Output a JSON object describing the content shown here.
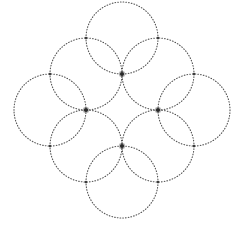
{
  "figure": {
    "canvas": {
      "width": 243,
      "height": 232,
      "background": "#ffffff"
    },
    "circle_radius": 36,
    "dot_color": "#545454",
    "dot_stroke_width": 1.1,
    "dot_dasharray": "0.7 2.05",
    "node_color": "#2a2a2a",
    "node_radius": 2,
    "node_halo_radius": 3.2,
    "node_halo_opacity": 0.3,
    "crossing_color": "#3c3c3c",
    "crossing_radius": 1.3,
    "circles": [
      {
        "name": "top",
        "cx": 122,
        "cy": 38
      },
      {
        "name": "upper-left",
        "cx": 86,
        "cy": 74
      },
      {
        "name": "upper-right",
        "cx": 158,
        "cy": 74
      },
      {
        "name": "left",
        "cx": 50,
        "cy": 110
      },
      {
        "name": "right",
        "cx": 194,
        "cy": 110
      },
      {
        "name": "lower-left",
        "cx": 86,
        "cy": 146
      },
      {
        "name": "lower-right",
        "cx": 158,
        "cy": 146
      },
      {
        "name": "bottom",
        "cx": 122,
        "cy": 182
      }
    ],
    "inner_nodes": [
      {
        "name": "inner-node-top",
        "x": 122,
        "y": 74
      },
      {
        "name": "inner-node-left",
        "x": 86,
        "y": 110
      },
      {
        "name": "inner-node-right",
        "x": 158,
        "y": 110
      },
      {
        "name": "inner-node-bottom",
        "x": 122,
        "y": 146
      }
    ],
    "outer_crossings": [
      {
        "name": "crossing-top-left",
        "x": 86,
        "y": 38
      },
      {
        "name": "crossing-top-right",
        "x": 158,
        "y": 38
      },
      {
        "name": "crossing-left-upper",
        "x": 50,
        "y": 74
      },
      {
        "name": "crossing-right-upper",
        "x": 194,
        "y": 74
      },
      {
        "name": "crossing-left-lower",
        "x": 50,
        "y": 146
      },
      {
        "name": "crossing-right-lower",
        "x": 194,
        "y": 146
      },
      {
        "name": "crossing-bottom-left",
        "x": 86,
        "y": 182
      },
      {
        "name": "crossing-bottom-right",
        "x": 158,
        "y": 182
      }
    ]
  }
}
